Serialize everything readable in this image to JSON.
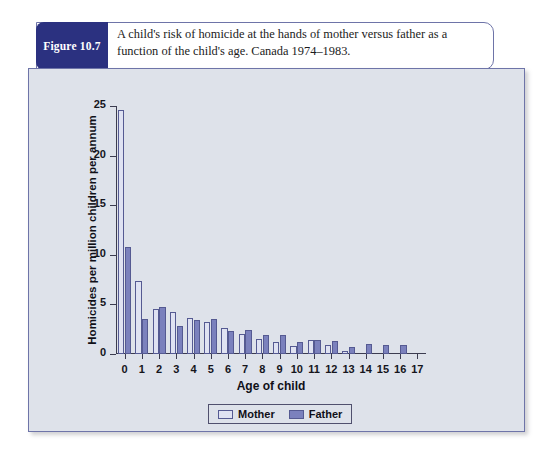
{
  "figure": {
    "badge_label": "Figure 10.7",
    "caption": "A child's risk of homicide at the hands of mother versus father as a function of the child's age. Canada 1974–1983."
  },
  "legend": {
    "mother_label": "Mother",
    "father_label": "Father"
  },
  "colors": {
    "badge_navy": "#2b3180",
    "panel_background": "#dee2ea",
    "mother_bar": "#dfe2f2",
    "father_bar": "#7b81bd",
    "bar_outline": "#555a92",
    "axis": "#3c3c50"
  },
  "chart_data": {
    "type": "bar",
    "title": "",
    "xlabel": "Age of child",
    "ylabel": "Homicides per million children per annum",
    "categories": [
      "0",
      "1",
      "2",
      "3",
      "4",
      "5",
      "6",
      "7",
      "8",
      "9",
      "10",
      "11",
      "12",
      "13",
      "14",
      "15",
      "16",
      "17"
    ],
    "ylim": [
      0,
      25
    ],
    "yticks": [
      0,
      5,
      10,
      15,
      20,
      25
    ],
    "grid": false,
    "legend_position": "bottom-center",
    "series": [
      {
        "name": "Mother",
        "values": [
          24.6,
          7.4,
          4.5,
          4.2,
          3.6,
          3.2,
          2.6,
          2.0,
          1.5,
          1.2,
          0.8,
          1.4,
          0.9,
          0.3,
          0.0,
          0.0,
          0.0,
          0.0
        ]
      },
      {
        "name": "Father",
        "values": [
          10.8,
          3.5,
          4.7,
          2.8,
          3.4,
          3.5,
          2.3,
          2.4,
          1.9,
          1.9,
          1.2,
          1.4,
          1.3,
          0.7,
          1.0,
          0.9,
          0.9,
          0.0
        ]
      }
    ]
  }
}
